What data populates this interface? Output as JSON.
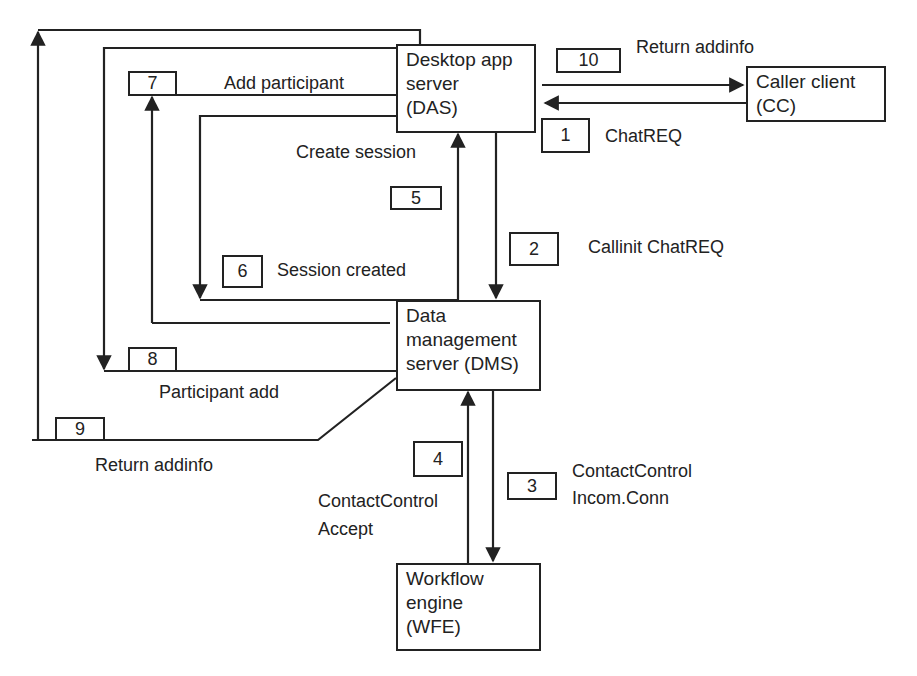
{
  "diagram": {
    "nodes": {
      "das": {
        "line1": "Desktop app",
        "line2": "server",
        "line3": "(DAS)"
      },
      "cc": {
        "line1": "Caller client",
        "line2": "(CC)"
      },
      "dms": {
        "line1": "Data",
        "line2": "management",
        "line3": "server (DMS)"
      },
      "wfe": {
        "line1": "Workflow",
        "line2": "engine",
        "line3": "(WFE)"
      }
    },
    "steps": [
      {
        "number": "1",
        "label": "ChatREQ",
        "from": "CC",
        "to": "DAS"
      },
      {
        "number": "2",
        "label": "Callinit ChatREQ",
        "from": "DAS",
        "to": "DMS"
      },
      {
        "number": "3",
        "label_line1": "ContactControl",
        "label_line2": "Incom.Conn",
        "from": "DMS",
        "to": "WFE"
      },
      {
        "number": "4",
        "label_line1": "ContactControl",
        "label_line2": "Accept",
        "from": "WFE",
        "to": "DMS"
      },
      {
        "number": "5",
        "label": "Create session",
        "from": "DMS",
        "to": "DAS"
      },
      {
        "number": "6",
        "label": "Session created",
        "from": "DAS",
        "to": "DMS"
      },
      {
        "number": "7",
        "label": "Add participant",
        "from": "DMS",
        "to": "DAS"
      },
      {
        "number": "8",
        "label": "Participant add",
        "from": "DAS",
        "to": "DMS"
      },
      {
        "number": "9",
        "label": "Return addinfo",
        "from": "DMS",
        "to": "DAS"
      },
      {
        "number": "10",
        "label": "Return addinfo",
        "from": "DAS",
        "to": "CC"
      }
    ],
    "line_color": "#222222",
    "background": "#ffffff"
  }
}
